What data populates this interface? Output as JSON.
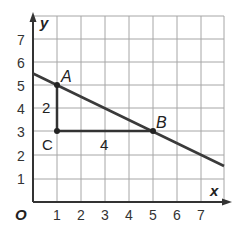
{
  "diagram": {
    "x_axis_label": "x",
    "y_axis_label": "y",
    "origin_label": "O",
    "x_ticks": [
      "1",
      "2",
      "3",
      "4",
      "5",
      "6",
      "7"
    ],
    "y_ticks": [
      "1",
      "2",
      "3",
      "4",
      "5",
      "6",
      "7"
    ],
    "points": {
      "A": {
        "label": "A",
        "x": 1,
        "y": 5
      },
      "B": {
        "label": "B",
        "x": 5,
        "y": 3
      },
      "C": {
        "label": "C",
        "x": 1,
        "y": 3
      }
    },
    "rise_label": "2",
    "run_label": "4",
    "line": {
      "x1": -0.5,
      "y1": 5.5,
      "x2": 7.5,
      "y2": 1.5
    },
    "colors": {
      "grid": "#999999",
      "axis": "#333333",
      "line": "#3a3a3a"
    }
  }
}
